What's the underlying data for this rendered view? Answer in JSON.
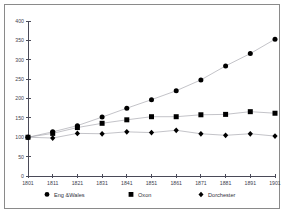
{
  "chart_data": {
    "type": "line",
    "title": "",
    "subtitle": "",
    "xlabel": "",
    "ylabel": "",
    "x": [
      1801,
      1811,
      1821,
      1831,
      1841,
      1851,
      1861,
      1871,
      1881,
      1891,
      1901
    ],
    "xtick_labels": [
      "1801",
      "1811",
      "1821",
      "1831",
      "1841",
      "1851",
      "1861",
      "1871",
      "1881",
      "1891",
      "1901"
    ],
    "ytick_labels": [
      "0",
      "50",
      "100",
      "150",
      "200",
      "250",
      "300",
      "350",
      "400"
    ],
    "ytick_values": [
      0,
      50,
      100,
      150,
      200,
      250,
      300,
      350,
      400
    ],
    "ylim": [
      0,
      400
    ],
    "xlim": [
      1801,
      1901
    ],
    "grid": false,
    "legend_position": "bottom",
    "series": [
      {
        "name": "Eng &Wales",
        "marker": "circle",
        "values": [
          100,
          114,
          130,
          152,
          175,
          197,
          220,
          248,
          284,
          316,
          353
        ]
      },
      {
        "name": "Oxon",
        "marker": "square",
        "values": [
          100,
          110,
          125,
          136,
          145,
          153,
          153,
          158,
          159,
          166,
          162
        ]
      },
      {
        "name": "Dorchester",
        "marker": "diamond",
        "values": [
          100,
          98,
          110,
          109,
          114,
          112,
          118,
          109,
          105,
          109,
          103
        ]
      }
    ]
  },
  "legend": {
    "items": [
      {
        "label": "Eng &Wales",
        "marker": "circle"
      },
      {
        "label": "Oxon",
        "marker": "square"
      },
      {
        "label": "Dorchester",
        "marker": "diamond"
      }
    ]
  },
  "colors": {
    "marker": "#0b0b12",
    "line": "#9a9aa2",
    "axis": "#4a4a58",
    "text": "#32323c",
    "border": "#8a8a8a",
    "background": "#ffffff"
  }
}
